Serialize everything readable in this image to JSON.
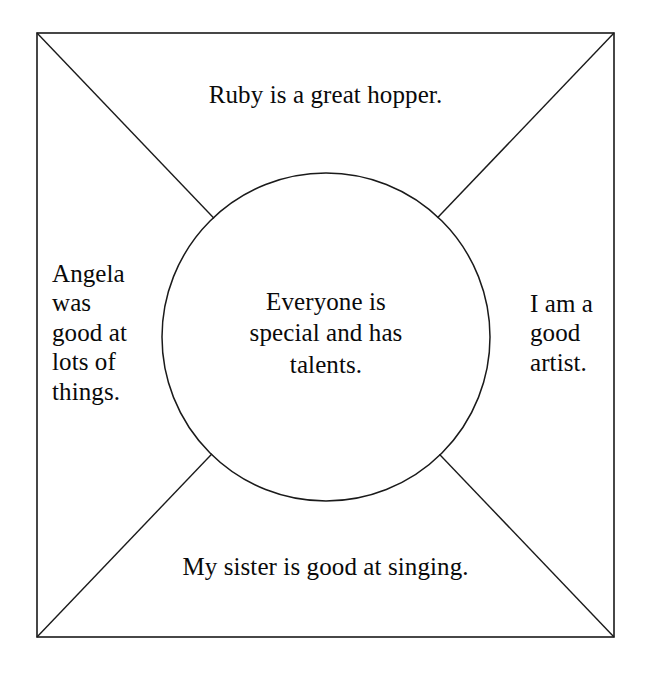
{
  "document": {
    "type": "placemat-graphic-organizer",
    "background_color": "#ffffff",
    "ink_color": "#1a1a1a",
    "text_color": "#0a0a0a"
  },
  "frame": {
    "shape": "square",
    "x": 37,
    "y": 33,
    "width": 577,
    "height": 604,
    "stroke_width": 1.6
  },
  "diagonals": {
    "count": 2,
    "description": "corner-to-corner lines dividing the square into four triangular quadrants"
  },
  "circle": {
    "center_x": 326,
    "center_y": 337,
    "radius": 164,
    "stroke_width": 1.5
  },
  "quadrants": {
    "top": {
      "label": "top-quadrant",
      "text": "Ruby is a great hopper."
    },
    "left": {
      "label": "left-quadrant",
      "text": "Angela\nwas\ngood at\nlots of\nthings."
    },
    "right": {
      "label": "right-quadrant",
      "text": "I am a\ngood\nartist."
    },
    "bottom": {
      "label": "bottom-quadrant",
      "text": "My sister is good at singing."
    }
  },
  "center": {
    "label": "center-circle",
    "text": "Everyone is\nspecial and has\ntalents."
  }
}
